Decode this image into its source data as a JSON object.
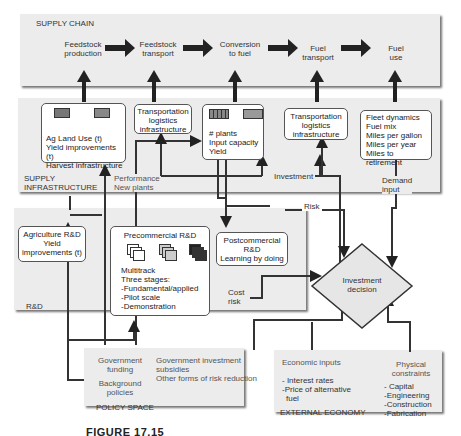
{
  "supply_chain": {
    "title": "SUPPLY CHAIN",
    "stages": [
      {
        "line1": "Feedstock",
        "line2": "production"
      },
      {
        "line1": "Feedstock",
        "line2": "transport"
      },
      {
        "line1": "Conversion",
        "line2": "to fuel"
      },
      {
        "line1": "Fuel",
        "line2": "transport"
      },
      {
        "line1": "Fuel",
        "line2": "use"
      }
    ]
  },
  "supply_infrastructure": {
    "title_line1": "SUPPLY",
    "title_line2": "INFRASTRUCTURE",
    "boxes": {
      "agriculture": {
        "lines": [
          "Ag Land Use (t)",
          "Yield improvements (t)",
          "Harvest infrastructure"
        ]
      },
      "transport1": {
        "lines": [
          "Transportation",
          "logistics",
          "infrastructure"
        ]
      },
      "conversion": {
        "lines": [
          "# plants",
          "Input capacity",
          "Yield"
        ]
      },
      "transport2": {
        "lines": [
          "Transportation",
          "logistics",
          "infrastructure"
        ]
      },
      "fuel_use": {
        "lines": [
          "Fleet dynamics",
          "Fuel mix",
          "Miles per gallon",
          "Miles per year",
          "Miles to retirement"
        ]
      }
    },
    "labels": {
      "performance": "Performance",
      "new_plants": "New plants",
      "investment": "Investment",
      "demand_line1": "Demand",
      "demand_line2": "input",
      "risk": "Risk"
    }
  },
  "rnd": {
    "title": "R&D",
    "agriculture_box": {
      "lines": [
        "Agriculture R&D",
        "Yield",
        "improvements (t)"
      ]
    },
    "precommercial_box": {
      "title": "Precommercial R&D",
      "lines": [
        "Multitrack",
        "Three stages:",
        "-Fundamental/applied",
        "-Pilot scale",
        "-Demonstration"
      ]
    },
    "postcommercial_box": {
      "lines": [
        "Postcommercial",
        "R&D",
        "Learning by doing"
      ]
    },
    "cost_risk_line1": "Cost",
    "cost_risk_line2": "risk"
  },
  "investment_decision": {
    "line1": "Investment",
    "line2": "decision"
  },
  "policy_space": {
    "title": "POLICY SPACE",
    "gov_funding_line1": "Government",
    "gov_funding_line2": "funding",
    "background_line1": "Background",
    "background_line2": "policies",
    "gov_investment_lines": [
      "Government investment",
      "subsidies",
      "Other forms of risk reduction"
    ]
  },
  "external_economy": {
    "title": "EXTERNAL ECONOMY",
    "economic_inputs_title": "Economic inputs",
    "economic_inputs": [
      "- Interest rates",
      "-Price of alternative",
      "fuel"
    ],
    "physical_title_line1": "Physical",
    "physical_title_line2": "constraints",
    "physical_items": [
      "- Capital",
      "-Engineering",
      "-Construction",
      "-Fabrication"
    ]
  },
  "caption": "FIGURE 17.15"
}
